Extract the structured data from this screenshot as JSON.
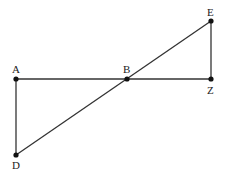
{
  "diagram": {
    "points": {
      "A": {
        "label": "A",
        "x": 16,
        "y": 79
      },
      "B": {
        "label": "B",
        "x": 127,
        "y": 79
      },
      "Z": {
        "label": "Z",
        "x": 211,
        "y": 79
      },
      "E": {
        "label": "E",
        "x": 211,
        "y": 21
      },
      "D": {
        "label": "D",
        "x": 16,
        "y": 155
      }
    },
    "segments": [
      [
        "A",
        "Z"
      ],
      [
        "A",
        "D"
      ],
      [
        "D",
        "E"
      ],
      [
        "E",
        "Z"
      ]
    ],
    "colors": {
      "line": "#333333",
      "point": "#111111",
      "label": "#222222"
    }
  }
}
